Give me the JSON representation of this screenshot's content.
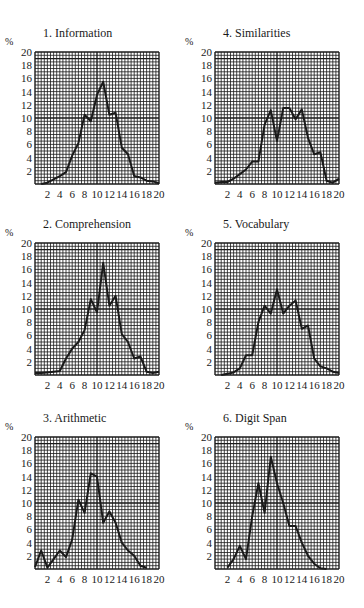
{
  "page": {
    "background": "#ffffff",
    "ink": "#1a1a1a"
  },
  "chart_data": [
    {
      "id": 1,
      "type": "line",
      "title": "1. Information",
      "ylabel": "%",
      "xlabel": "",
      "xlim": [
        0,
        20
      ],
      "ylim": [
        0,
        20
      ],
      "grid": true,
      "x_ticks": [
        "2",
        "4",
        "6",
        "8",
        "10",
        "12",
        "14",
        "16",
        "18",
        "20"
      ],
      "y_ticks": [
        "2",
        "4",
        "6",
        "8",
        "10",
        "12",
        "14",
        "16",
        "18",
        "20"
      ],
      "x": [
        1,
        2,
        3,
        4,
        5,
        6,
        7,
        8,
        9,
        10,
        11,
        12,
        13,
        14,
        15,
        16,
        17,
        18,
        19,
        20
      ],
      "values": [
        0,
        0.2,
        0.7,
        1.2,
        1.8,
        4.3,
        6.2,
        10.5,
        9.5,
        13.5,
        15.5,
        10.5,
        10.8,
        5.5,
        4.5,
        1.2,
        1,
        0.5,
        0.4,
        0.1
      ]
    },
    {
      "id": 2,
      "type": "line",
      "title": "2. Comprehension",
      "ylabel": "%",
      "xlabel": "",
      "xlim": [
        0,
        20
      ],
      "ylim": [
        0,
        20
      ],
      "grid": true,
      "x_ticks": [
        "2",
        "4",
        "6",
        "8",
        "10",
        "12",
        "14",
        "16",
        "18",
        "20"
      ],
      "y_ticks": [
        "2",
        "4",
        "6",
        "8",
        "10",
        "12",
        "14",
        "16",
        "18",
        "20"
      ],
      "x": [
        0,
        1,
        2,
        3,
        4,
        5,
        6,
        7,
        8,
        9,
        10,
        11,
        12,
        13,
        14,
        15,
        16,
        17,
        18,
        19,
        20
      ],
      "values": [
        0.3,
        0.3,
        0.4,
        0.5,
        0.6,
        2.5,
        4,
        5,
        6.8,
        11.5,
        9.5,
        17,
        10.5,
        12,
        6.2,
        5,
        2.5,
        2.8,
        0.5,
        0.3,
        0.5
      ]
    },
    {
      "id": 3,
      "type": "line",
      "title": "3. Arithmetic",
      "ylabel": "%",
      "xlabel": "",
      "xlim": [
        0,
        20
      ],
      "ylim": [
        0,
        20
      ],
      "grid": true,
      "x_ticks": [
        "2",
        "4",
        "6",
        "8",
        "10",
        "12",
        "14",
        "16",
        "18",
        "20"
      ],
      "y_ticks": [
        "2",
        "4",
        "6",
        "8",
        "10",
        "12",
        "14",
        "16",
        "18",
        "20"
      ],
      "x": [
        0,
        1,
        2,
        3,
        4,
        5,
        6,
        7,
        8,
        9,
        10,
        11,
        12,
        13,
        14,
        15,
        16,
        17,
        18
      ],
      "values": [
        0.3,
        2.8,
        0.2,
        1.5,
        2.8,
        1.8,
        4.5,
        10.5,
        8.5,
        14.5,
        14,
        7,
        8.7,
        7,
        4,
        2.8,
        2,
        0.5,
        0.2
      ]
    },
    {
      "id": 4,
      "type": "line",
      "title": "4. Similarities",
      "ylabel": "%",
      "xlabel": "",
      "xlim": [
        0,
        20
      ],
      "ylim": [
        0,
        20
      ],
      "grid": true,
      "x_ticks": [
        "2",
        "4",
        "6",
        "8",
        "10",
        "12",
        "14",
        "16",
        "18",
        "20"
      ],
      "y_ticks": [
        "2",
        "4",
        "6",
        "8",
        "10",
        "12",
        "14",
        "16",
        "18",
        "20"
      ],
      "x": [
        0,
        1,
        2,
        3,
        4,
        5,
        6,
        7,
        8,
        9,
        10,
        11,
        12,
        13,
        14,
        15,
        16,
        17,
        18,
        19,
        20
      ],
      "values": [
        0.2,
        0.3,
        0.3,
        0.8,
        1.5,
        2.2,
        3.4,
        3.4,
        9,
        11.2,
        6.5,
        11.5,
        11.5,
        9.8,
        11.3,
        7,
        4.5,
        4.8,
        0.5,
        0.2,
        0.8
      ]
    },
    {
      "id": 5,
      "type": "line",
      "title": "5. Vocabulary",
      "ylabel": "%",
      "xlabel": "",
      "xlim": [
        0,
        20
      ],
      "ylim": [
        0,
        20
      ],
      "grid": true,
      "x_ticks": [
        "2",
        "4",
        "6",
        "8",
        "10",
        "12",
        "14",
        "16",
        "18",
        "20"
      ],
      "y_ticks": [
        "2",
        "4",
        "6",
        "8",
        "10",
        "12",
        "14",
        "16",
        "18",
        "20"
      ],
      "x": [
        1,
        2,
        3,
        4,
        5,
        6,
        7,
        8,
        9,
        10,
        11,
        12,
        13,
        14,
        15,
        16,
        17,
        18,
        19,
        20
      ],
      "values": [
        0,
        0.2,
        0.4,
        1,
        3,
        3,
        8,
        10.5,
        9.3,
        13,
        9.3,
        10.5,
        11.3,
        7,
        7.5,
        2.5,
        1.3,
        1,
        0.5,
        0.3
      ]
    },
    {
      "id": 6,
      "type": "line",
      "title": "6. Digit Span",
      "ylabel": "%",
      "xlabel": "",
      "xlim": [
        0,
        20
      ],
      "ylim": [
        0,
        20
      ],
      "grid": true,
      "x_ticks": [
        "2",
        "4",
        "6",
        "8",
        "10",
        "12",
        "14",
        "16",
        "18",
        "20"
      ],
      "y_ticks": [
        "2",
        "4",
        "6",
        "8",
        "10",
        "12",
        "14",
        "16",
        "18",
        "20"
      ],
      "x": [
        2,
        3,
        4,
        5,
        6,
        7,
        8,
        9,
        10,
        11,
        12,
        13,
        14,
        15,
        16,
        17,
        18
      ],
      "values": [
        0.2,
        1.5,
        3.5,
        1.5,
        8,
        13,
        8.5,
        17,
        13,
        10,
        6.5,
        6.5,
        4,
        2,
        0.8,
        0.1,
        0
      ]
    }
  ],
  "layout": {
    "panels": [
      {
        "chart": 0,
        "left": 0,
        "top": 0,
        "gx": 35,
        "gy": 52
      },
      {
        "chart": 3,
        "left": 182,
        "top": 0,
        "gx": 215,
        "gy": 52
      },
      {
        "chart": 1,
        "left": 0,
        "top": 196,
        "gx": 35,
        "gy": 243
      },
      {
        "chart": 4,
        "left": 182,
        "top": 196,
        "gx": 215,
        "gy": 243
      },
      {
        "chart": 2,
        "left": 0,
        "top": 392,
        "gx": 35,
        "gy": 437
      },
      {
        "chart": 5,
        "left": 182,
        "top": 392,
        "gx": 215,
        "gy": 437
      }
    ],
    "grid_w": 124,
    "grid_h": 132
  }
}
